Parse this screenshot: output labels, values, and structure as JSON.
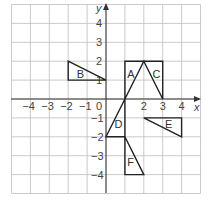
{
  "diagram": {
    "title": "",
    "axes": {
      "x_label": "x",
      "y_label": "y",
      "x_range": [
        -5,
        5
      ],
      "y_range": [
        -5,
        5
      ],
      "x_ticks": [
        "-4",
        "-3",
        "-2",
        "-1",
        "0",
        "2",
        "3",
        "4"
      ],
      "y_ticks": [
        "4",
        "3",
        "2",
        "1",
        "-1",
        "-2",
        "-3",
        "-4"
      ],
      "origin_label": "0"
    },
    "shapes": [
      {
        "label": "A",
        "vertices": [
          [
            1,
            2
          ],
          [
            2,
            2
          ],
          [
            1,
            0
          ]
        ]
      },
      {
        "label": "B",
        "vertices": [
          [
            -2,
            2
          ],
          [
            -2,
            1
          ],
          [
            0,
            1
          ]
        ]
      },
      {
        "label": "C",
        "vertices": [
          [
            2,
            2
          ],
          [
            3,
            2
          ],
          [
            3,
            0
          ]
        ]
      },
      {
        "label": "D",
        "vertices": [
          [
            0,
            -2
          ],
          [
            1,
            -2
          ],
          [
            1,
            0
          ]
        ]
      },
      {
        "label": "E",
        "vertices": [
          [
            2,
            -1
          ],
          [
            4,
            -1
          ],
          [
            4,
            -2
          ]
        ]
      },
      {
        "label": "F",
        "vertices": [
          [
            1,
            -2
          ],
          [
            1,
            -4
          ],
          [
            2,
            -4
          ]
        ]
      }
    ],
    "colors": {
      "grid": "#bdbdbd",
      "axis": "#333333",
      "shape": "#222222"
    }
  }
}
